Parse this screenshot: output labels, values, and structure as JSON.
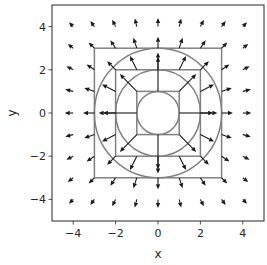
{
  "chart_data": {
    "type": "quiver",
    "title": "",
    "xlabel": "x",
    "ylabel": "y",
    "xlim": [
      -5,
      5
    ],
    "ylim": [
      -5,
      5
    ],
    "xticks": [
      -4,
      -2,
      0,
      2,
      4
    ],
    "yticks": [
      -4,
      -2,
      0,
      2,
      4
    ],
    "xtick_labels": [
      "−4",
      "−2",
      "0",
      "2",
      "4"
    ],
    "ytick_labels": [
      "−4",
      "−2",
      "0",
      "2",
      "4"
    ],
    "grid": false,
    "legend": null,
    "aspect": "equal",
    "vector_field": {
      "description": "Radial outward field, magnitude proportional to 1/r, sampled on integer grid; origin omitted",
      "grid_x": [
        -4,
        -3,
        -2,
        -1,
        0,
        1,
        2,
        3,
        4
      ],
      "grid_y": [
        -4,
        -3,
        -2,
        -1,
        0,
        1,
        2,
        3,
        4
      ],
      "u_formula": "x / (x^2 + y^2)",
      "v_formula": "y / (x^2 + y^2)",
      "display_scale": 1.6,
      "arrow_color": "#1a1a1a"
    },
    "shapes": [
      {
        "type": "circle",
        "center": [
          0,
          0
        ],
        "radius": 1,
        "color": "#808080"
      },
      {
        "type": "circle",
        "center": [
          0,
          0
        ],
        "radius": 2,
        "color": "#808080"
      },
      {
        "type": "circle",
        "center": [
          0,
          0
        ],
        "radius": 3,
        "color": "#808080"
      },
      {
        "type": "square",
        "center": [
          0,
          0
        ],
        "half_side": 1,
        "color": "#808080"
      },
      {
        "type": "square",
        "center": [
          0,
          0
        ],
        "half_side": 2,
        "color": "#808080"
      },
      {
        "type": "square",
        "center": [
          0,
          0
        ],
        "half_side": 3,
        "color": "#808080"
      }
    ]
  },
  "colors": {
    "shape_line": "#808080",
    "arrow": "#1a1a1a",
    "axes": "#262626",
    "background": "#ffffff"
  }
}
